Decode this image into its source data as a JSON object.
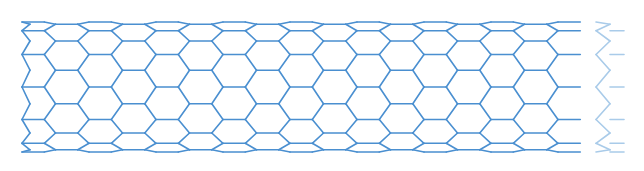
{
  "diagram": {
    "colors": {
      "bond": "#4a8fd0",
      "bond_faded": "#a9cbe9",
      "background": "#ffffff"
    },
    "tube": {
      "left_x": 22,
      "right_x": 590,
      "top_y": 22,
      "bottom_y": 152,
      "center_y": 87,
      "hex_period_x": 67
    },
    "row_lines_y": [
      22,
      32,
      42,
      53,
      69,
      87,
      104,
      120,
      132,
      142,
      152
    ]
  }
}
